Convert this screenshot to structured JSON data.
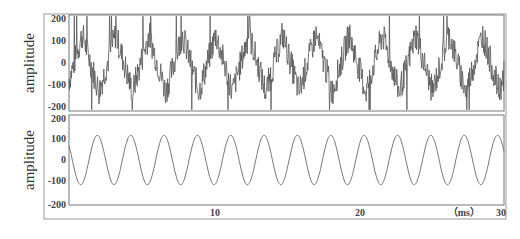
{
  "chart_data": [
    {
      "type": "line",
      "title": "",
      "description": "Noisy composite signal: triangular-ish periodic waveform with high-frequency jitter",
      "xlabel": "(ms)",
      "ylabel": "amplitude",
      "xlim": [
        0,
        30
      ],
      "ylim": [
        -200,
        200
      ],
      "yticks": [
        200,
        100,
        0,
        -100,
        -200
      ],
      "ytick_labels": [
        "200",
        "100",
        "0",
        "-100",
        "-200"
      ],
      "grid": false,
      "legend": null,
      "series": [
        {
          "name": "noisy signal",
          "base_period_ms": 2.3,
          "base_amplitude": 120,
          "noise_amplitude": 60,
          "min": -200,
          "max": 200
        }
      ]
    },
    {
      "type": "line",
      "title": "",
      "description": "Clean sinusoid",
      "xlabel": "(ms)",
      "ylabel": "amplitude",
      "xlim": [
        0,
        30
      ],
      "ylim": [
        -200,
        200
      ],
      "yticks": [
        200,
        100,
        0,
        -100,
        -200
      ],
      "ytick_labels": [
        "200",
        "100",
        "0",
        "-100",
        "-200"
      ],
      "xticks": [
        10,
        20,
        30
      ],
      "xtick_labels": [
        "10",
        "20",
        "30"
      ],
      "grid": false,
      "legend": null,
      "series": [
        {
          "name": "sine",
          "period_ms": 2.3,
          "amplitude": 110,
          "cycles_visible": 13
        }
      ]
    }
  ],
  "labels": {
    "top_ylabel": "amplitude",
    "bottom_ylabel": "amplitude",
    "x_unit": "（ms）",
    "x_ticks": [
      "10",
      "20",
      "30"
    ],
    "y_ticks": [
      "200",
      "100",
      "0",
      "-100",
      "-200"
    ]
  }
}
